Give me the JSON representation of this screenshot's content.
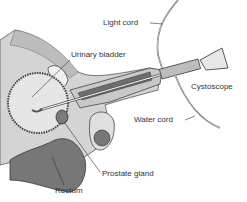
{
  "figure": {
    "labels": {
      "light_cord": "Light cord",
      "urinary_bladder": "Urinary bladder",
      "cystoscope": "Cystoscope",
      "water_cord": "Water cord",
      "prostate_gland": "Prostate gland",
      "rectum": "Rectum"
    }
  },
  "colors": {
    "ink": "#333333",
    "tissue_light": "#d9d9d9",
    "tissue_mid": "#a6a6a6",
    "tissue_dark": "#5a5a5a",
    "background": "#ffffff"
  }
}
